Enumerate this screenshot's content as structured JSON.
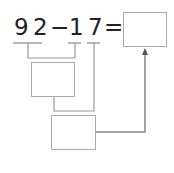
{
  "equation": {
    "minuend_tens": "9",
    "minuend_ones": "2",
    "operator": "−",
    "subtrahend_tens": "1",
    "subtrahend_ones": "7",
    "equals": "="
  },
  "boxes": {
    "answer_box": "",
    "step1_box": "",
    "step2_box": ""
  },
  "colors": {
    "text": "#222222",
    "line": "#999999",
    "box_border": "#aaaaaa"
  }
}
